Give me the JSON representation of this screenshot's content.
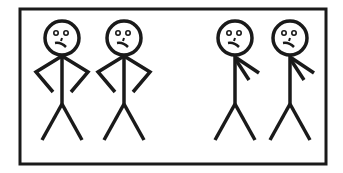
{
  "illustration": {
    "description": "Four stick figures in a rectangular frame",
    "stroke_color": "#1a1a1a",
    "background": "#ffffff",
    "figures": [
      {
        "name": "figure-1",
        "pose": "hands-on-hips",
        "expression": "frown"
      },
      {
        "name": "figure-2",
        "pose": "hands-on-hips",
        "expression": "frown"
      },
      {
        "name": "figure-3",
        "pose": "hand-on-chest",
        "expression": "frown"
      },
      {
        "name": "figure-4",
        "pose": "hand-on-chest",
        "expression": "frown"
      }
    ]
  }
}
